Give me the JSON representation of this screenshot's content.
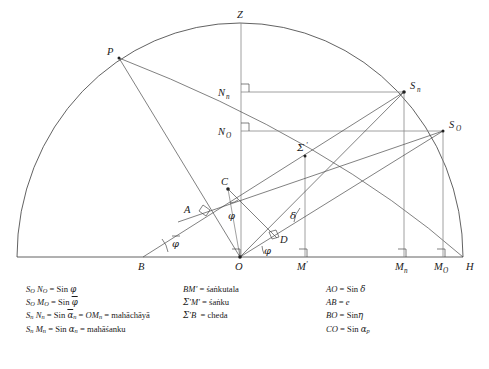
{
  "figure": {
    "type": "geometric-astronomy-diagram",
    "background": "#ffffff",
    "stroke_color": "#3a3a3a"
  },
  "points": [
    {
      "id": "Z",
      "label": "Z",
      "sub": "",
      "x": 241,
      "y": 23,
      "label_dx": -1,
      "label_dy": -6,
      "name": "zenith"
    },
    {
      "id": "P",
      "label": "P",
      "sub": "",
      "x": 119,
      "y": 58,
      "label_dx": -10,
      "label_dy": -4,
      "name": "pole"
    },
    {
      "id": "Sn",
      "label": "S",
      "sub": "n",
      "x": 404,
      "y": 92,
      "label_dx": 7,
      "label_dy": -4,
      "name": "sun-n"
    },
    {
      "id": "SO",
      "label": "S",
      "sub": "O",
      "x": 443,
      "y": 131,
      "label_dx": 7,
      "label_dy": -4,
      "name": "sun-o"
    },
    {
      "id": "Nn",
      "label": "N",
      "sub": "n",
      "x": 241,
      "y": 92,
      "label_dx": -20,
      "label_dy": 4,
      "name": "foot-n"
    },
    {
      "id": "NO",
      "label": "N",
      "sub": "O",
      "x": 241,
      "y": 131,
      "label_dx": -20,
      "label_dy": 4,
      "name": "foot-o"
    },
    {
      "id": "Sigma",
      "label": "Σ",
      "sub": "'",
      "x": 305,
      "y": 156,
      "label_dx": -6,
      "label_dy": -5,
      "name": "sigma-prime"
    },
    {
      "id": "C",
      "label": "C",
      "sub": "",
      "x": 228,
      "y": 189,
      "label_dx": -4,
      "label_dy": -6,
      "name": "point-c"
    },
    {
      "id": "A",
      "label": "A",
      "sub": "",
      "x": 197,
      "y": 211,
      "label_dx": -11,
      "label_dy": 1,
      "name": "point-a"
    },
    {
      "id": "D",
      "label": "D",
      "sub": "",
      "x": 277,
      "y": 239,
      "label_dx": 4,
      "label_dy": 5,
      "name": "point-d"
    },
    {
      "id": "B",
      "label": "B",
      "sub": "",
      "x": 143,
      "y": 257,
      "label_dx": -3,
      "label_dy": 13,
      "name": "point-b"
    },
    {
      "id": "O",
      "label": "O",
      "sub": "",
      "x": 240,
      "y": 257,
      "label_dx": -3,
      "label_dy": 13,
      "name": "origin"
    },
    {
      "id": "Mprime",
      "label": "M",
      "sub": "'",
      "x": 305,
      "y": 257,
      "label_dx": -5,
      "label_dy": 13,
      "name": "m-prime"
    },
    {
      "id": "Mn",
      "label": "M",
      "sub": "n",
      "x": 404,
      "y": 257,
      "label_dx": -6,
      "label_dy": 13,
      "name": "m-n"
    },
    {
      "id": "MO",
      "label": "M",
      "sub": "O",
      "x": 443,
      "y": 257,
      "label_dx": -6,
      "label_dy": 13,
      "name": "m-o"
    },
    {
      "id": "H",
      "label": "H",
      "sub": "",
      "x": 463,
      "y": 257,
      "label_dx": 3,
      "label_dy": 13,
      "name": "horizon-end"
    }
  ],
  "angles": [
    {
      "id": "phi_C",
      "glyph": "φ",
      "x": 231,
      "y": 215,
      "name": "angle-phi-at-c"
    },
    {
      "id": "phi_bar",
      "glyph": "φ",
      "x": 176,
      "y": 243,
      "overline": true,
      "name": "angle-phi-bar-at-b"
    },
    {
      "id": "delta",
      "glyph": "δ",
      "x": 293,
      "y": 215,
      "name": "angle-delta"
    },
    {
      "id": "phi_O",
      "glyph": "φ",
      "x": 266,
      "y": 250,
      "name": "angle-phi-at-o"
    }
  ],
  "legend": {
    "left": [
      {
        "lhs": "Sₒ Nₒ",
        "rhs": "Sin φ"
      },
      {
        "lhs": "Sₒ Mₒ",
        "rhs": "Sin φ̄"
      },
      {
        "lhs": "Sₙ Nₙ",
        "rhs": "Sin āₙ = OMₙ = mahāchāyā"
      },
      {
        "lhs": "Sₙ Mₙ",
        "rhs": "Sin αₙ = mahāśanku"
      }
    ],
    "middle": [
      {
        "lhs": "BM'",
        "rhs": "śaṅkutala"
      },
      {
        "lhs": "Σ'M'",
        "rhs": "śaṅku"
      },
      {
        "lhs": "Σ'B",
        "rhs": "cheda"
      }
    ],
    "right": [
      {
        "lhs": "AO",
        "rhs": "Sin δ"
      },
      {
        "lhs": "AB",
        "rhs": "e"
      },
      {
        "lhs": "BO",
        "rhs": "Sin η"
      },
      {
        "lhs": "CO",
        "rhs": "Sin αₚ"
      }
    ]
  }
}
